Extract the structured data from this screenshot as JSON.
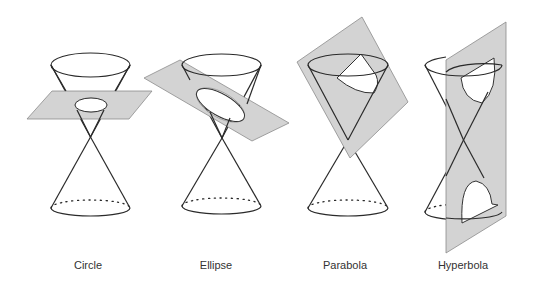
{
  "figure": {
    "panels": [
      {
        "id": "circle",
        "label": "Circle",
        "description": "Horizontal plane cuts cone perpendicular to axis"
      },
      {
        "id": "ellipse",
        "label": "Ellipse",
        "description": "Tilted plane cuts one nappe fully"
      },
      {
        "id": "parabola",
        "label": "Parabola",
        "description": "Plane parallel to cone side"
      },
      {
        "id": "hyperbola",
        "label": "Hyperbola",
        "description": "Vertical plane cuts both nappes"
      }
    ],
    "colors": {
      "plane_fill": "#d3d3d3",
      "plane_stroke": "#8c8c8c",
      "line": "#2a2a2a",
      "background": "#ffffff"
    }
  }
}
